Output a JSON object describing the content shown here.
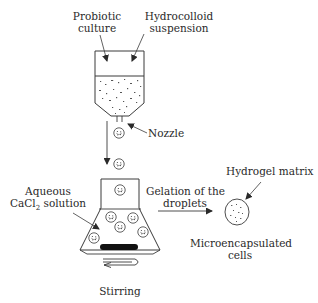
{
  "diagram": {
    "type": "process-flow",
    "title": "",
    "labels": {
      "probiotic_culture_line1": "Probiotic",
      "probiotic_culture_line2": "culture",
      "hydrocolloid_line1": "Hydrocolloid",
      "hydrocolloid_line2": "suspension",
      "nozzle": "Nozzle",
      "aqueous_line1": "Aqueous",
      "aqueous_line2_pre": "CaCl",
      "aqueous_line2_sub": "2",
      "aqueous_line2_post": " solution",
      "gelation_line1": "Gelation of the",
      "gelation_line2": "droplets",
      "hydrogel_matrix": "Hydrogel matrix",
      "microencapsulated_line1": "Microencapsulated",
      "microencapsulated_line2": "cells",
      "stirring": "Stirring"
    },
    "nodes": [
      {
        "id": "feed-container",
        "label": "Probiotic culture + Hydrocolloid suspension"
      },
      {
        "id": "nozzle",
        "label": "Nozzle"
      },
      {
        "id": "droplet",
        "label": "Droplet"
      },
      {
        "id": "flask",
        "label": "Aqueous CaCl2 solution"
      },
      {
        "id": "stir-bar",
        "label": "Stirring"
      },
      {
        "id": "microcapsule",
        "label": "Microencapsulated cells"
      }
    ],
    "edges": [
      {
        "from": "feed-container",
        "to": "nozzle"
      },
      {
        "from": "nozzle",
        "to": "flask",
        "label": ""
      },
      {
        "from": "flask",
        "to": "microcapsule",
        "label": "Gelation of the droplets"
      }
    ],
    "colors": {
      "stroke": "#3a3a3a",
      "text": "#2a2a2a",
      "stir_bar": "#111111",
      "background": "#ffffff"
    }
  }
}
